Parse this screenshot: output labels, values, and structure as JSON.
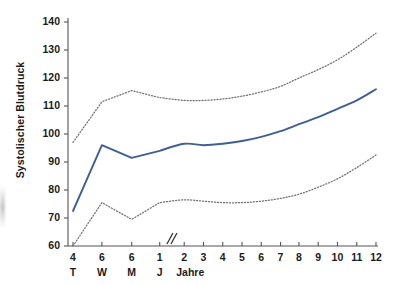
{
  "chart_data": {
    "type": "line",
    "title": "",
    "subtitle": "",
    "xlabel": "Jahre",
    "ylabel": "Systolischer Blutdruck",
    "ylim": [
      60,
      140
    ],
    "yticks": [
      60,
      70,
      80,
      90,
      100,
      110,
      120,
      130,
      140
    ],
    "grid": false,
    "legend": null,
    "axis_break": {
      "symbol": "//",
      "between": [
        "1 J",
        "2"
      ],
      "x_px": 185
    },
    "x_categories": [
      {
        "label": "4",
        "sub": "T",
        "x_px": 73
      },
      {
        "label": "6",
        "sub": "W",
        "x_px": 106
      },
      {
        "label": "6",
        "sub": "M",
        "x_px": 140
      },
      {
        "label": "1",
        "sub": "J",
        "x_px": 172
      },
      {
        "label": "2",
        "sub": "",
        "x_px": 200
      },
      {
        "label": "3",
        "sub": "",
        "x_px": 222
      },
      {
        "label": "4",
        "sub": "",
        "x_px": 244
      },
      {
        "label": "5",
        "sub": "",
        "x_px": 266
      },
      {
        "label": "6",
        "sub": "",
        "x_px": 288
      },
      {
        "label": "7",
        "sub": "",
        "x_px": 310
      },
      {
        "label": "8",
        "sub": "",
        "x_px": 331
      },
      {
        "label": "9",
        "sub": "",
        "x_px": 353
      },
      {
        "label": "10",
        "sub": "",
        "x_px": 375
      },
      {
        "label": "11",
        "sub": "",
        "x_px": 397
      },
      {
        "label": "12",
        "sub": "",
        "x_px": 419
      }
    ],
    "unit_label": "Jahre",
    "series": [
      {
        "name": "oberes Perzentil",
        "style": "dotted",
        "color": "#6f6f6f",
        "x": [
          "4 T",
          "6 W",
          "6 M",
          "1 J",
          "2",
          "3",
          "4",
          "5",
          "6",
          "7",
          "8",
          "9",
          "10",
          "11",
          "12"
        ],
        "values": [
          97,
          111.5,
          115.5,
          113,
          112,
          112,
          112.5,
          113.5,
          115,
          117,
          120,
          123,
          126.5,
          131,
          136
        ]
      },
      {
        "name": "Median",
        "style": "solid",
        "color": "#3f5f96",
        "x": [
          "4 T",
          "6 W",
          "6 M",
          "1 J",
          "2",
          "3",
          "4",
          "5",
          "6",
          "7",
          "8",
          "9",
          "10",
          "11",
          "12"
        ],
        "values": [
          72.5,
          96,
          91.5,
          94,
          96.5,
          96,
          96.5,
          97.5,
          99,
          101,
          103.5,
          106,
          109,
          112,
          116
        ]
      },
      {
        "name": "unteres Perzentil",
        "style": "dotted",
        "color": "#6f6f6f",
        "x": [
          "4 T",
          "6 W",
          "6 M",
          "1 J",
          "2",
          "3",
          "4",
          "5",
          "6",
          "7",
          "8",
          "9",
          "10",
          "11",
          "12"
        ],
        "values": [
          60,
          75.5,
          69.5,
          75.5,
          76.5,
          76,
          75.5,
          75.5,
          76,
          77,
          78.5,
          81,
          84,
          88,
          92.5
        ]
      }
    ]
  }
}
